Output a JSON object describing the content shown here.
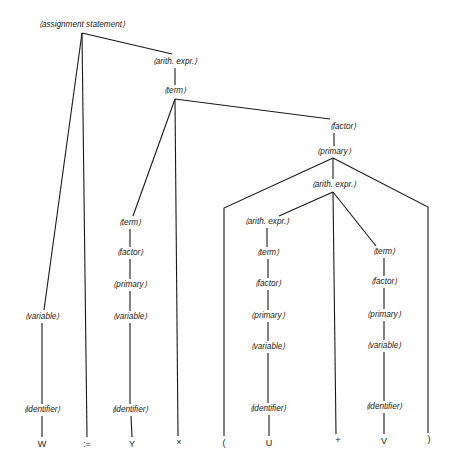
{
  "diagram": {
    "type": "parse-tree",
    "colors": {
      "line": "#1a1a1a",
      "text": "#1a1a1a",
      "background": "#ffffff"
    },
    "nodes": [
      {
        "id": "assign",
        "label": "⟨assignment statement⟩",
        "x": 82,
        "y": 25
      },
      {
        "id": "ae1",
        "label": "⟨arith. expr.⟩",
        "x": 175,
        "y": 62
      },
      {
        "id": "term1",
        "label": "⟨term⟩",
        "x": 175,
        "y": 91
      },
      {
        "id": "factor1",
        "label": "⟨factor⟩",
        "x": 343,
        "y": 127
      },
      {
        "id": "primary1",
        "label": "⟨primary⟩",
        "x": 334,
        "y": 152
      },
      {
        "id": "ae2",
        "label": "⟨arith. expr.⟩",
        "x": 334,
        "y": 185
      },
      {
        "id": "ae3",
        "label": "⟨arith. expr.⟩",
        "x": 267,
        "y": 222
      },
      {
        "id": "term2",
        "label": "⟨term⟩",
        "x": 130,
        "y": 223
      },
      {
        "id": "factor2",
        "label": "⟨factor⟩",
        "x": 130,
        "y": 253
      },
      {
        "id": "primary2",
        "label": "⟨primary⟩",
        "x": 130,
        "y": 285
      },
      {
        "id": "variable2",
        "label": "⟨variable⟩",
        "x": 130,
        "y": 317
      },
      {
        "id": "ident2",
        "label": "⟨identifier⟩",
        "x": 130,
        "y": 410
      },
      {
        "id": "variable1",
        "label": "⟨variable⟩",
        "x": 42,
        "y": 317
      },
      {
        "id": "ident1",
        "label": "⟨identifier⟩",
        "x": 42,
        "y": 410
      },
      {
        "id": "term3",
        "label": "⟨term⟩",
        "x": 268,
        "y": 253
      },
      {
        "id": "factor3",
        "label": "⟨factor⟩",
        "x": 268,
        "y": 284
      },
      {
        "id": "primary3",
        "label": "⟨primary⟩",
        "x": 268,
        "y": 316
      },
      {
        "id": "variable3",
        "label": "⟨variable⟩",
        "x": 268,
        "y": 347
      },
      {
        "id": "ident3",
        "label": "⟨identifier⟩",
        "x": 268,
        "y": 409
      },
      {
        "id": "term4",
        "label": "⟨term⟩",
        "x": 384,
        "y": 252
      },
      {
        "id": "factor4",
        "label": "⟨factor⟩",
        "x": 384,
        "y": 282
      },
      {
        "id": "primary4",
        "label": "⟨primary⟩",
        "x": 384,
        "y": 315
      },
      {
        "id": "variable4",
        "label": "⟨variable⟩",
        "x": 384,
        "y": 346
      },
      {
        "id": "ident4",
        "label": "⟨identifier⟩",
        "x": 384,
        "y": 407
      }
    ],
    "terminals": [
      {
        "id": "t_W",
        "label": "W",
        "x": 42,
        "y": 444
      },
      {
        "id": "t_assign",
        "label": ":=",
        "x": 87,
        "y": 444
      },
      {
        "id": "t_Y",
        "label": "Y",
        "x": 132,
        "y": 444
      },
      {
        "id": "t_times",
        "label": "×",
        "x": 179,
        "y": 442
      },
      {
        "id": "t_lparen",
        "label": "(",
        "x": 224,
        "y": 443
      },
      {
        "id": "t_U",
        "label": "U",
        "x": 269,
        "y": 443
      },
      {
        "id": "t_plus",
        "label": "+",
        "x": 338,
        "y": 440
      },
      {
        "id": "t_V",
        "label": "V",
        "x": 384,
        "y": 441
      },
      {
        "id": "t_rparen",
        "label": ")",
        "x": 429,
        "y": 439
      }
    ],
    "edges": [
      {
        "from": "assign",
        "to": "variable1",
        "points": [
          [
            82,
            33
          ],
          [
            44,
            310
          ]
        ]
      },
      {
        "from": "assign",
        "to": "t_assign",
        "points": [
          [
            82,
            33
          ],
          [
            87,
            437
          ]
        ]
      },
      {
        "from": "assign",
        "to": "ae1",
        "points": [
          [
            82,
            33
          ],
          [
            172,
            54
          ]
        ]
      },
      {
        "from": "ae1",
        "to": "term1",
        "points": [
          [
            175,
            68
          ],
          [
            175,
            85
          ]
        ]
      },
      {
        "from": "term1",
        "to": "term2",
        "points": [
          [
            175,
            99
          ],
          [
            133,
            216
          ]
        ]
      },
      {
        "from": "term1",
        "to": "t_times",
        "points": [
          [
            175,
            99
          ],
          [
            178,
            436
          ]
        ]
      },
      {
        "from": "term1",
        "to": "factor1",
        "points": [
          [
            175,
            99
          ],
          [
            330,
            119
          ]
        ]
      },
      {
        "from": "factor1",
        "to": "primary1",
        "points": [
          [
            334,
            133
          ],
          [
            334,
            146
          ]
        ]
      },
      {
        "from": "primary1",
        "to": "t_lparen",
        "points": [
          [
            333,
            158
          ],
          [
            224,
            208
          ],
          [
            224,
            436
          ]
        ]
      },
      {
        "from": "primary1",
        "to": "ae2",
        "points": [
          [
            333,
            158
          ],
          [
            333,
            179
          ]
        ]
      },
      {
        "from": "primary1",
        "to": "t_rparen",
        "points": [
          [
            333,
            158
          ],
          [
            428,
            207
          ],
          [
            428,
            433
          ]
        ]
      },
      {
        "from": "ae2",
        "to": "ae3",
        "points": [
          [
            333,
            192
          ],
          [
            279,
            216
          ]
        ]
      },
      {
        "from": "ae2",
        "to": "t_plus",
        "points": [
          [
            333,
            192
          ],
          [
            336,
            434
          ]
        ]
      },
      {
        "from": "ae2",
        "to": "term4",
        "points": [
          [
            333,
            192
          ],
          [
            376,
            246
          ]
        ]
      },
      {
        "from": "variable1",
        "to": "ident1",
        "points": [
          [
            42,
            323
          ],
          [
            42,
            404
          ]
        ]
      },
      {
        "from": "ident1",
        "to": "t_W",
        "points": [
          [
            42,
            416
          ],
          [
            42,
            437
          ]
        ]
      },
      {
        "from": "term2",
        "to": "factor2",
        "points": [
          [
            130,
            229
          ],
          [
            130,
            247
          ]
        ]
      },
      {
        "from": "factor2",
        "to": "primary2",
        "points": [
          [
            130,
            259
          ],
          [
            130,
            279
          ]
        ]
      },
      {
        "from": "primary2",
        "to": "variable2",
        "points": [
          [
            130,
            291
          ],
          [
            130,
            311
          ]
        ]
      },
      {
        "from": "variable2",
        "to": "ident2",
        "points": [
          [
            130,
            323
          ],
          [
            130,
            404
          ]
        ]
      },
      {
        "from": "ident2",
        "to": "t_Y",
        "points": [
          [
            131,
            416
          ],
          [
            132,
            437
          ]
        ]
      },
      {
        "from": "ae3",
        "to": "term3",
        "points": [
          [
            267,
            228
          ],
          [
            267,
            247
          ]
        ]
      },
      {
        "from": "term3",
        "to": "factor3",
        "points": [
          [
            268,
            259
          ],
          [
            268,
            278
          ]
        ]
      },
      {
        "from": "factor3",
        "to": "primary3",
        "points": [
          [
            268,
            290
          ],
          [
            268,
            310
          ]
        ]
      },
      {
        "from": "primary3",
        "to": "variable3",
        "points": [
          [
            268,
            322
          ],
          [
            268,
            341
          ]
        ]
      },
      {
        "from": "variable3",
        "to": "ident3",
        "points": [
          [
            268,
            353
          ],
          [
            268,
            403
          ]
        ]
      },
      {
        "from": "ident3",
        "to": "t_U",
        "points": [
          [
            269,
            415
          ],
          [
            269,
            436
          ]
        ]
      },
      {
        "from": "term4",
        "to": "factor4",
        "points": [
          [
            384,
            258
          ],
          [
            384,
            276
          ]
        ]
      },
      {
        "from": "factor4",
        "to": "primary4",
        "points": [
          [
            384,
            288
          ],
          [
            384,
            309
          ]
        ]
      },
      {
        "from": "primary4",
        "to": "variable4",
        "points": [
          [
            384,
            321
          ],
          [
            384,
            340
          ]
        ]
      },
      {
        "from": "variable4",
        "to": "ident4",
        "points": [
          [
            384,
            352
          ],
          [
            384,
            401
          ]
        ]
      },
      {
        "from": "ident4",
        "to": "t_V",
        "points": [
          [
            384,
            413
          ],
          [
            384,
            434
          ]
        ]
      }
    ]
  }
}
